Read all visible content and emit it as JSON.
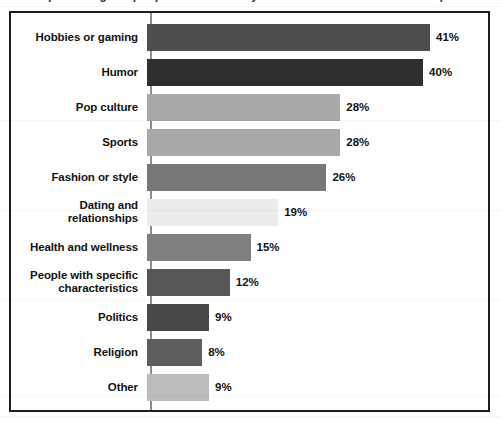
{
  "page": {
    "top_fragment": "percentage of people who said they follow accounts about each topic"
  },
  "chart_data": {
    "type": "bar",
    "orientation": "horizontal",
    "title": "",
    "subtitle": "",
    "xlabel": "",
    "ylabel": "",
    "xlim": [
      0,
      41
    ],
    "grid": false,
    "legend": "none",
    "value_suffix": "%",
    "categories": [
      "Hobbies or gaming",
      "Humor",
      "Pop culture",
      "Sports",
      "Fashion or style",
      "Dating and relationships",
      "Health and wellness",
      "People with specific characteristics",
      "Politics",
      "Religion",
      "Other"
    ],
    "values": [
      41,
      40,
      28,
      28,
      26,
      19,
      15,
      12,
      9,
      8,
      9
    ],
    "value_labels": [
      "41%",
      "40%",
      "28%",
      "28%",
      "26%",
      "19%",
      "15%",
      "12%",
      "9%",
      "8%",
      "9%"
    ],
    "bar_colors": [
      "#4e4e4e",
      "#2f2f2f",
      "#a9a9a9",
      "#a9a9a9",
      "#787878",
      "#ececec",
      "#7f7f7f",
      "#575757",
      "#474747",
      "#5e5e5e",
      "#bcbcbc"
    ],
    "bars": [
      {
        "label": "Hobbies or gaming",
        "label_line1": "Hobbies or gaming",
        "label_line2": "",
        "value": 41,
        "value_label": "41%",
        "color": "#4e4e4e"
      },
      {
        "label": "Humor",
        "label_line1": "Humor",
        "label_line2": "",
        "value": 40,
        "value_label": "40%",
        "color": "#2f2f2f"
      },
      {
        "label": "Pop culture",
        "label_line1": "Pop culture",
        "label_line2": "",
        "value": 28,
        "value_label": "28%",
        "color": "#a9a9a9"
      },
      {
        "label": "Sports",
        "label_line1": "Sports",
        "label_line2": "",
        "value": 28,
        "value_label": "28%",
        "color": "#a9a9a9"
      },
      {
        "label": "Fashion or style",
        "label_line1": "Fashion or style",
        "label_line2": "",
        "value": 26,
        "value_label": "26%",
        "color": "#787878"
      },
      {
        "label": "Dating and relationships",
        "label_line1": "Dating and relationships",
        "label_line2": "",
        "value": 19,
        "value_label": "19%",
        "color": "#ececec"
      },
      {
        "label": "Health and wellness",
        "label_line1": "Health and wellness",
        "label_line2": "",
        "value": 15,
        "value_label": "15%",
        "color": "#7f7f7f"
      },
      {
        "label": "People with specific characteristics",
        "label_line1": "People with specific",
        "label_line2": "characteristics",
        "value": 12,
        "value_label": "12%",
        "color": "#575757"
      },
      {
        "label": "Politics",
        "label_line1": "Politics",
        "label_line2": "",
        "value": 9,
        "value_label": "9%",
        "color": "#474747"
      },
      {
        "label": "Religion",
        "label_line1": "Religion",
        "label_line2": "",
        "value": 8,
        "value_label": "8%",
        "color": "#5e5e5e"
      },
      {
        "label": "Other",
        "label_line1": "Other",
        "label_line2": "",
        "value": 9,
        "value_label": "9%",
        "color": "#bcbcbc"
      }
    ]
  }
}
